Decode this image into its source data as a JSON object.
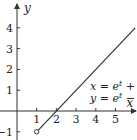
{
  "chart_data": {
    "type": "line",
    "title": "",
    "xlabel": "x",
    "ylabel": "y",
    "xlim": [
      -0.85,
      6.0
    ],
    "ylim": [
      -1.4,
      5.0
    ],
    "grid": false,
    "x_ticks": [
      1,
      2,
      3,
      4,
      5
    ],
    "y_ticks": [
      -1,
      1,
      2,
      3,
      4
    ],
    "series": [
      {
        "name": "x = e^t + 1, y = e^t - 1",
        "equation": "y = x - 2",
        "x": [
          1,
          6
        ],
        "y": [
          -1,
          4
        ],
        "start_point": {
          "x": 1,
          "y": -1,
          "marker": "open-circle"
        }
      }
    ],
    "annotation": {
      "line1": {
        "lhs": "x",
        "eq": " = ",
        "base": "e",
        "exp": "t",
        "rest": " + 1,"
      },
      "line2": {
        "lhs": "y",
        "eq": " = ",
        "base": "e",
        "exp": "t",
        "rest": " − 1"
      }
    }
  },
  "colors": {
    "axis": "#333333",
    "curve": "#333333",
    "text": "#222222"
  }
}
